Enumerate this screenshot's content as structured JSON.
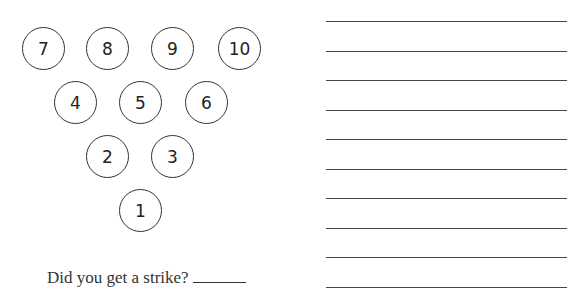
{
  "pins": [
    {
      "label": "7",
      "x": 44,
      "y": 49
    },
    {
      "label": "8",
      "x": 108,
      "y": 49
    },
    {
      "label": "9",
      "x": 173,
      "y": 49
    },
    {
      "label": "10",
      "x": 240,
      "y": 49
    },
    {
      "label": "4",
      "x": 76,
      "y": 103
    },
    {
      "label": "5",
      "x": 141,
      "y": 103
    },
    {
      "label": "6",
      "x": 207,
      "y": 103
    },
    {
      "label": "2",
      "x": 108,
      "y": 157
    },
    {
      "label": "3",
      "x": 173,
      "y": 157
    },
    {
      "label": "1",
      "x": 141,
      "y": 211
    }
  ],
  "question": {
    "text": "Did you get a strike?",
    "answer": ""
  },
  "writing_lines": [
    21,
    51,
    80,
    110,
    139,
    169,
    198,
    228,
    257,
    287
  ]
}
